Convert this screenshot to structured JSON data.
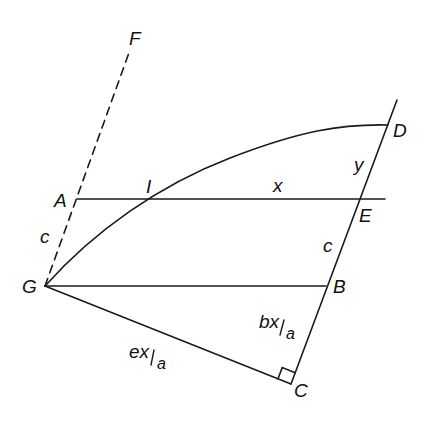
{
  "diagram": {
    "type": "geometric construction",
    "points": {
      "A": {
        "label": "A",
        "x": 77,
        "y": 199
      },
      "B": {
        "label": "B",
        "x": 326,
        "y": 286
      },
      "C": {
        "label": "C",
        "x": 291,
        "y": 384
      },
      "D": {
        "label": "D",
        "x": 388,
        "y": 125
      },
      "E": {
        "label": "E",
        "x": 358,
        "y": 199
      },
      "F": {
        "label": "F",
        "x": 130,
        "y": 50
      },
      "G": {
        "label": "G",
        "x": 45,
        "y": 286
      },
      "I": {
        "label": "I",
        "x": 151,
        "y": 199
      }
    },
    "segment_labels": {
      "AI_E": "x",
      "DE": "y",
      "EB": "c",
      "GA": "c",
      "BC_num": "bx",
      "BC_den": "a",
      "GC_num": "ex",
      "GC_den": "a"
    },
    "colors": {
      "stroke": "#1a1a1a",
      "background": "#ffffff"
    }
  }
}
